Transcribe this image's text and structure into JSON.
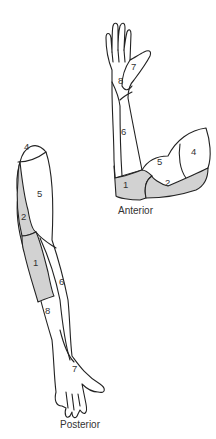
{
  "diagram": {
    "views": [
      {
        "id": "anterior",
        "caption": "Anterior",
        "regions": [
          {
            "label": "1",
            "shaded": true
          },
          {
            "label": "2",
            "shaded": true
          },
          {
            "label": "4",
            "shaded": false
          },
          {
            "label": "5",
            "shaded": false
          },
          {
            "label": "6",
            "shaded": false
          },
          {
            "label": "7",
            "shaded": false
          },
          {
            "label": "8",
            "shaded": false
          }
        ]
      },
      {
        "id": "posterior",
        "caption": "Posterior",
        "regions": [
          {
            "label": "4",
            "shaded": false
          },
          {
            "label": "5",
            "shaded": false
          },
          {
            "label": "2",
            "shaded": true
          },
          {
            "label": "1",
            "shaded": true
          },
          {
            "label": "6",
            "shaded": false
          },
          {
            "label": "8",
            "shaded": false
          },
          {
            "label": "7",
            "shaded": false
          }
        ]
      }
    ],
    "colors": {
      "shaded": "#d2d2d2",
      "outline": "#222222",
      "background": "#ffffff"
    }
  }
}
